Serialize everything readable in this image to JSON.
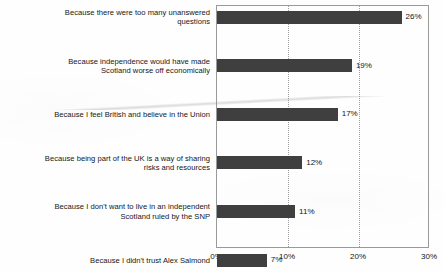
{
  "chart_data": {
    "type": "bar",
    "orientation": "horizontal",
    "title": "",
    "subtitle": "",
    "xlabel": "",
    "ylabel": "",
    "xlim": [
      0,
      30
    ],
    "xticks": [
      0,
      10,
      20,
      30
    ],
    "xtick_labels": [
      "0%",
      "10%",
      "20%",
      "30%"
    ],
    "grid": "vertical-dotted",
    "legend": "none",
    "value_suffix": "%",
    "bar_color": "#3f3f3f",
    "categories": [
      "Because there were too many unanswered\nquestions",
      "Because independence would have made\nScotland worse off economically",
      "Because I feel British and believe in the Union",
      "Because being part of the UK is a way of sharing\nrisks and resources",
      "Because I don't want to live in an independent\nScotland ruled by the SNP",
      "Because I didn't trust Alex Salmond",
      "Because Scotland is going to get the extra powers\nI want anyway",
      "Because I wanted to vote Yes but in the end it\nseemed a bit too risky",
      "Because it would make Britain a more equal\nsociety",
      "Something else / DK / NA"
    ],
    "values": [
      26,
      19,
      17,
      12,
      11,
      7,
      3,
      1,
      1,
      3
    ],
    "value_labels": [
      "26%",
      "19%",
      "17%",
      "12%",
      "11%",
      "7%",
      "3%",
      "1%",
      "1%",
      "3%"
    ]
  }
}
